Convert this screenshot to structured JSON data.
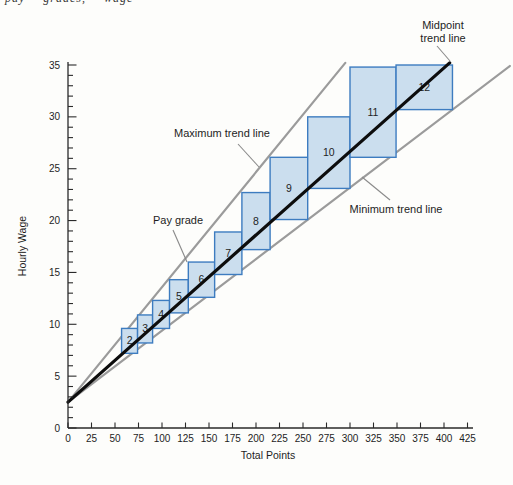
{
  "cropped_caption_fragment": "pay grades, wage",
  "chart_data": {
    "type": "scatter",
    "subtype": "pay-structure-scattergram",
    "title": "",
    "xlabel": "Total Points",
    "ylabel": "Hourly Wage",
    "xlim": [
      0,
      425
    ],
    "ylim": [
      0,
      35
    ],
    "xtick_step": 25,
    "ytick_major_step": 5,
    "ytick_minor_step": 1,
    "grid": "off",
    "axis_color": "#2a2a2a",
    "text_color": "#1e1e1e",
    "box_style": {
      "fill": "#cbdeee",
      "stroke": "#3d7cc0",
      "stroke_width": 1.4
    },
    "trend_lines": [
      {
        "name": "Maximum trend line",
        "color": "#9b9b9b",
        "width": 2.2,
        "layer": "under",
        "from": {
          "points": 0,
          "wage": 2.5
        },
        "to": {
          "points": 295,
          "wage": 35.2
        }
      },
      {
        "name": "Minimum trend line",
        "color": "#9b9b9b",
        "width": 2.2,
        "layer": "under",
        "from": {
          "points": 0,
          "wage": 2.5
        },
        "to": {
          "points": 470,
          "wage": 34.9
        }
      },
      {
        "name": "Midpoint trend line",
        "color": "#0d0d0d",
        "width": 3.2,
        "layer": "over",
        "from": {
          "points": 0,
          "wage": 2.5
        },
        "to": {
          "points": 406,
          "wage": 35.2
        }
      }
    ],
    "pay_grades": [
      {
        "grade": "2",
        "points_min": 57,
        "points_max": 74,
        "wage_min": 7.2,
        "wage_max": 9.6
      },
      {
        "grade": "3",
        "points_min": 74,
        "points_max": 90,
        "wage_min": 8.2,
        "wage_max": 10.9
      },
      {
        "grade": "4",
        "points_min": 90,
        "points_max": 108,
        "wage_min": 9.6,
        "wage_max": 12.3
      },
      {
        "grade": "5",
        "points_min": 108,
        "points_max": 128,
        "wage_min": 11.1,
        "wage_max": 14.3
      },
      {
        "grade": "6",
        "points_min": 128,
        "points_max": 156,
        "wage_min": 12.6,
        "wage_max": 16.0
      },
      {
        "grade": "7",
        "points_min": 156,
        "points_max": 185,
        "wage_min": 14.8,
        "wage_max": 18.9
      },
      {
        "grade": "8",
        "points_min": 185,
        "points_max": 215,
        "wage_min": 17.2,
        "wage_max": 22.7
      },
      {
        "grade": "9",
        "points_min": 215,
        "points_max": 255,
        "wage_min": 20.1,
        "wage_max": 26.1
      },
      {
        "grade": "10",
        "points_min": 255,
        "points_max": 300,
        "wage_min": 23.1,
        "wage_max": 30.0
      },
      {
        "grade": "11",
        "points_min": 300,
        "points_max": 349,
        "wage_min": 26.1,
        "wage_max": 34.8
      },
      {
        "grade": "12",
        "points_min": 349,
        "points_max": 409,
        "wage_min": 30.7,
        "wage_max": 35.0
      }
    ],
    "annotations": [
      {
        "id": "midpoint-trend-line-label",
        "lines": [
          "Midpoint",
          "trend line"
        ],
        "x": 443,
        "y": 29,
        "leader": [
          437,
          46,
          450,
          61
        ]
      },
      {
        "id": "maximum-trend-line-label",
        "lines": [
          "Maximum trend line"
        ],
        "x": 222,
        "y": 137,
        "leader": [
          238,
          144,
          259,
          167
        ]
      },
      {
        "id": "pay-grade-label",
        "lines": [
          "Pay grade"
        ],
        "x": 178,
        "y": 224,
        "leader": [
          173,
          230,
          187,
          262
        ]
      },
      {
        "id": "minimum-trend-line-label",
        "lines": [
          "Minimum trend line"
        ],
        "x": 396,
        "y": 213,
        "leader": [
          390,
          200,
          362,
          177
        ]
      }
    ]
  }
}
